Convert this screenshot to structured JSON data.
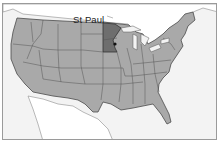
{
  "map": {
    "title": "United States",
    "highlight_state": "Minnesota",
    "city_label": "St Paul",
    "colors": {
      "land": "#a9a9a9",
      "highlight": "#6e6e6e",
      "water": "#f3f3f3",
      "foreign_land": "#ffffff",
      "border": "#4a4a4a",
      "city_dot": "#111111"
    }
  }
}
